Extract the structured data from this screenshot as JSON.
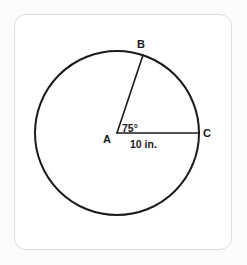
{
  "figure": {
    "kind": "circle-with-central-angle",
    "frame": {
      "border_color": "#dcdcdc",
      "background_color": "#ffffff",
      "page_background_color": "#fcfcfc"
    },
    "stroke_color": "#1a1a1a",
    "circle": {
      "center_label": "A",
      "center_x": 117,
      "center_y": 133,
      "radius_px": 82,
      "stroke_width": 2
    },
    "points": [
      {
        "id": "center",
        "label": "A",
        "x": 117,
        "y": 133,
        "label_x": 107,
        "label_y": 142
      },
      {
        "id": "arc-endpoint-b",
        "label": "B",
        "x": 143,
        "y": 55,
        "label_x": 140,
        "label_y": 48
      },
      {
        "id": "arc-endpoint-c",
        "label": "C",
        "x": 199,
        "y": 133,
        "label_x": 204,
        "label_y": 137
      }
    ],
    "radii": [
      {
        "id": "radius-ab",
        "from": "A",
        "to": "B",
        "x1": 117,
        "y1": 133,
        "x2": 143,
        "y2": 55
      },
      {
        "id": "radius-ac",
        "from": "A",
        "to": "C",
        "x1": 117,
        "y1": 133,
        "x2": 199,
        "y2": 133
      }
    ],
    "angle": {
      "id": "central-angle-bac",
      "value": "75",
      "unit_symbol": "°",
      "text": "75°",
      "label_x": 122,
      "label_y": 131
    },
    "length": {
      "id": "radius-length-ac",
      "text": "10 in.",
      "value": "10",
      "unit": "in.",
      "label_x": 131,
      "label_y": 147
    }
  },
  "chart_data": {
    "type": "diagram",
    "title": "",
    "labels": [
      "A",
      "B",
      "C",
      "75°",
      "10 in."
    ]
  }
}
